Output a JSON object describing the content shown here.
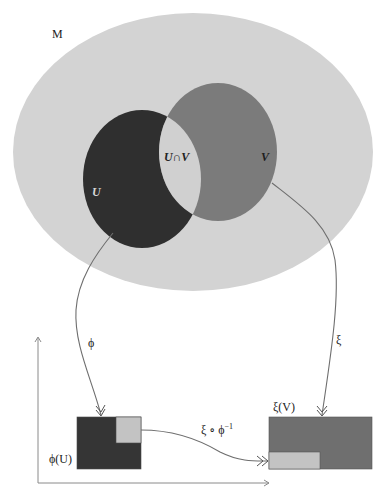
{
  "figure": {
    "manifold_label": "M",
    "chart_u_label": "U",
    "chart_v_label": "V",
    "intersection_label": "U∩V",
    "map_phi_label": "ϕ",
    "map_xi_label": "ξ",
    "transition_label": "ξ ∘ ϕ",
    "transition_exponent": "−1",
    "image_phi_u_label": "ϕ(U)",
    "image_xi_v_label": "ξ(V)"
  },
  "colors": {
    "manifold_fill": "#d3d3d3",
    "u_fill": "#2f2f2f",
    "v_fill": "#7b7b7b",
    "intersection_fill": "#d0d0d0",
    "phi_rect_fill": "#353535",
    "xi_rect_fill": "#6f6f6f",
    "overlap_rect_fill": "#c3c3c3",
    "line_color": "#6e6e6e"
  }
}
